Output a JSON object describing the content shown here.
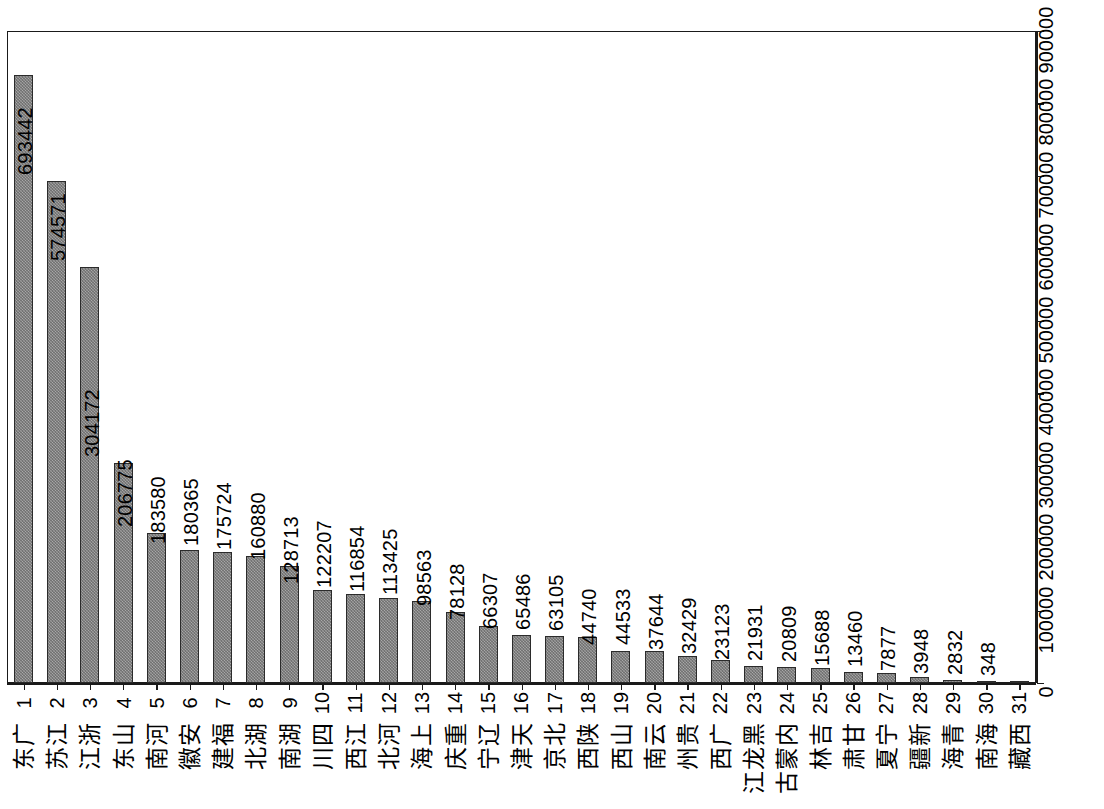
{
  "figure": {
    "orientation": "rotated-90",
    "plot_type": "bar",
    "bar_fill_color": "#9a9a9a",
    "bar_border_color": "#2b2b2b",
    "axis_color": "#1a1a1a",
    "background_color": "#ffffff"
  },
  "chart_data": {
    "type": "bar",
    "title": "",
    "xlabel": "",
    "ylabel": "",
    "ylim": [
      0,
      900000
    ],
    "grid": false,
    "legend": null,
    "orientation": "vertical-bars-rotated",
    "value_axis_ticks": [
      0,
      100000,
      200000,
      300000,
      400000,
      500000,
      600000,
      700000,
      800000,
      900000
    ],
    "value_axis_tick_labels": [
      "0",
      "100000",
      "200000",
      "300000",
      "400000",
      "500000",
      "600000",
      "700000",
      "800000",
      "900000"
    ],
    "ranks": [
      1,
      2,
      3,
      4,
      5,
      6,
      7,
      8,
      9,
      10,
      11,
      12,
      13,
      14,
      15,
      16,
      17,
      18,
      19,
      20,
      21,
      22,
      23,
      24,
      25,
      26,
      27,
      28,
      29,
      30,
      31
    ],
    "categories": [
      "广东",
      "江苏",
      "浙江",
      "山东",
      "河南",
      "安徽",
      "福建",
      "湖北",
      "湖南",
      "四川",
      "江西",
      "河北",
      "上海",
      "重庆",
      "辽宁",
      "天津",
      "北京",
      "陕西",
      "山西",
      "云南",
      "贵州",
      "广西",
      "黑龙江",
      "内蒙古",
      "吉林",
      "甘肃",
      "宁夏",
      "新疆",
      "青海",
      "海南",
      "西藏"
    ],
    "values": [
      838891,
      693442,
      574571,
      304172,
      206775,
      183580,
      180365,
      175724,
      160880,
      128713,
      122207,
      116854,
      113425,
      98563,
      78128,
      66307,
      65486,
      63105,
      44740,
      44533,
      37644,
      32429,
      23123,
      21931,
      20809,
      15688,
      13460,
      7877,
      3948,
      2832,
      348
    ],
    "value_labels": [
      "838891",
      "693442",
      "574571",
      "304172",
      "206775",
      "183580",
      "180365",
      "175724",
      "160880",
      "128713",
      "122207",
      "116854",
      "113425",
      "98563",
      "78128",
      "66307",
      "65486",
      "63105",
      "44740",
      "44533",
      "37644",
      "32429",
      "23123",
      "21931",
      "20809",
      "15688",
      "13460",
      "7877",
      "3948",
      "2832",
      "348"
    ]
  }
}
